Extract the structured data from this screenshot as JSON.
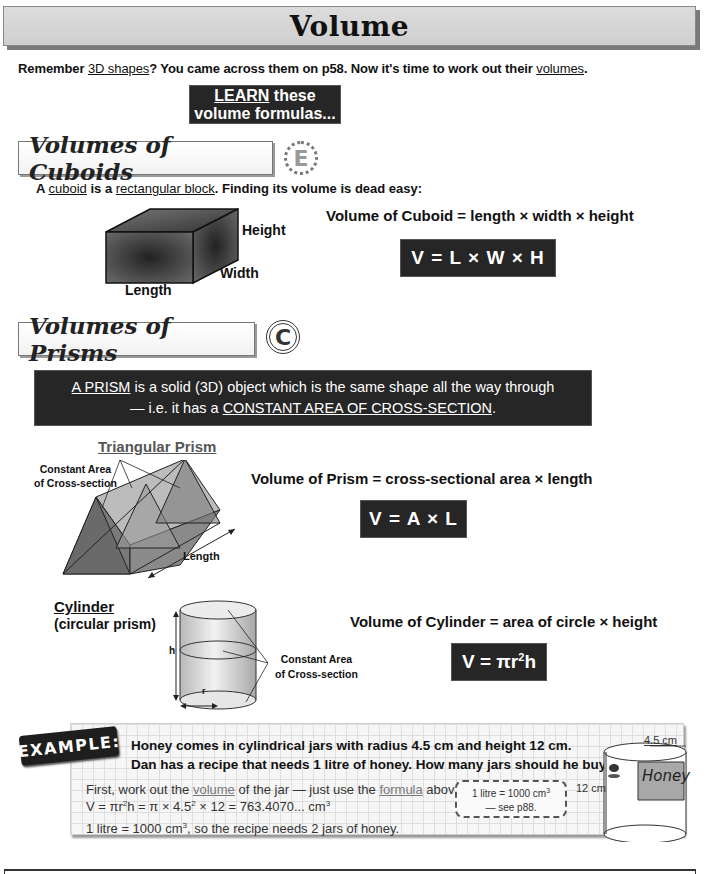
{
  "page": {
    "title": "Volume",
    "intro": {
      "before": "Remember ",
      "link1": "3D shapes",
      "middle": "?  You came across them on p58.  Now it's time to work out their ",
      "link2": "volumes",
      "after": "."
    },
    "learn_box": {
      "emph": "LEARN",
      "rest": " these volume formulas..."
    }
  },
  "cuboids": {
    "header": "Volumes of Cuboids",
    "grade": "E",
    "desc": {
      "before": "A ",
      "term1": "cuboid",
      "middle": " is a ",
      "term2": "rectangular block",
      "after": ".  Finding its volume is dead easy:"
    },
    "diagram_labels": {
      "height": "Height",
      "width": "Width",
      "length": "Length"
    },
    "formula_text": "Volume of Cuboid = length × width × height",
    "formula": "V = L × W × H"
  },
  "prisms": {
    "header": "Volumes of Prisms",
    "grade": "C",
    "definition": {
      "term": "A PRISM",
      "line1_rest": " is a solid (3D) object which is the same shape all the way through",
      "line2_before": "— i.e. it has a ",
      "line2_emph": "CONSTANT AREA OF CROSS-SECTION",
      "line2_after": "."
    },
    "triangular": {
      "title": "Triangular Prism",
      "label_cross_1": "Constant Area",
      "label_cross_2": "of Cross-section",
      "label_length": "Length"
    },
    "formula_text": "Volume of Prism = cross-sectional area × length",
    "formula": "V = A × L"
  },
  "cylinder": {
    "title": "Cylinder",
    "subtitle": "(circular prism)",
    "label_h": "h",
    "label_r": "r",
    "label_cross_1": "Constant Area",
    "label_cross_2": "of Cross-section",
    "formula_text": "Volume of Cylinder = area of circle × height",
    "formula_main": "V = πr",
    "formula_sup": "2",
    "formula_end": "h"
  },
  "example": {
    "tag": "EXAMPLE:",
    "question_line1": "Honey comes in cylindrical jars with radius 4.5 cm and height 12 cm.",
    "question_line2": "Dan has a recipe that needs 1 litre of honey.  How many jars should he buy?",
    "answer_line1": {
      "before": "First, work out the ",
      "link1": "volume",
      "middle": " of the jar — just use the ",
      "link2": "formula",
      "after": " above:"
    },
    "answer_line2": {
      "a": "V = πr",
      "b": "2",
      "c": "h = π × 4.5",
      "d": "2",
      "e": " × 12 = 763.4070... cm",
      "f": "3"
    },
    "answer_line3": {
      "a": "1 litre = 1000 cm",
      "b": "3",
      "c": ", so the recipe needs 2 jars of honey."
    },
    "note": {
      "line1_a": "1 litre = 1000 cm",
      "line1_b": "3",
      "line2": "— see p88."
    },
    "jar": {
      "radius_label": "4.5 cm",
      "height_label": "12 cm",
      "label": "Honey"
    }
  }
}
